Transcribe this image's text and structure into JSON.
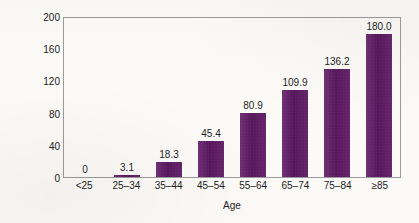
{
  "chart_data": {
    "type": "bar",
    "title": "",
    "categories": [
      "<25",
      "25–34",
      "35–44",
      "45–54",
      "55–64",
      "65–74",
      "75–84",
      "≥85"
    ],
    "values": [
      0,
      3.1,
      18.3,
      45.4,
      80.9,
      109.9,
      136.2,
      180.0
    ],
    "value_labels": [
      "0",
      "3.1",
      "18.3",
      "45.4",
      "80.9",
      "109.9",
      "136.2",
      "180.0"
    ],
    "xlabel": "Age",
    "ylabel": "Deaths/100,000 resident population",
    "ylim": [
      0,
      200
    ],
    "yticks": [
      0,
      40,
      80,
      120,
      160,
      200
    ],
    "ytick_labels": [
      "0",
      "40",
      "80",
      "120",
      "160",
      "200"
    ],
    "grid": false,
    "legend": false,
    "bar_color": "#5e1963",
    "frame_color": "#9b9b9b",
    "background_color": "#fbfaf7"
  }
}
